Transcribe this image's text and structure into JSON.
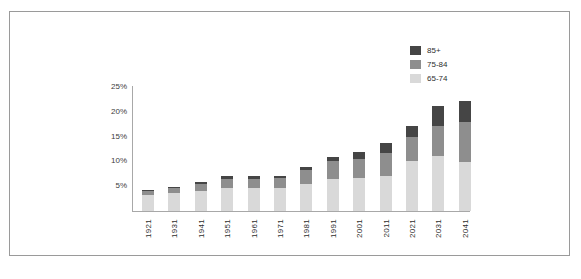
{
  "chart": {
    "frame_border_color": "#9a9a9a",
    "axis_color": "#a8a8a8"
  },
  "legend": {
    "position": "top-right",
    "items": [
      {
        "label": "85+",
        "color": "#454545"
      },
      {
        "label": "75-84",
        "color": "#8e8e8e"
      },
      {
        "label": "65-74",
        "color": "#d9d9d9"
      }
    ]
  },
  "yaxis": {
    "ticks": [
      "5%",
      "10%",
      "15%",
      "20%",
      "25%"
    ]
  },
  "caption": "",
  "chart_data": {
    "type": "bar",
    "stacked": true,
    "title": "",
    "xlabel": "",
    "ylabel": "",
    "ylim": [
      0,
      25
    ],
    "ytick_values": [
      5,
      10,
      15,
      20,
      25
    ],
    "ytick_labels": [
      "5%",
      "10%",
      "15%",
      "20%",
      "25%"
    ],
    "grid": false,
    "legend_position": "top-right",
    "categories": [
      "1921",
      "1931",
      "1941",
      "1951",
      "1961",
      "1971",
      "1981",
      "1991",
      "2001",
      "2011",
      "2021",
      "2031",
      "2041"
    ],
    "series": [
      {
        "name": "65-74",
        "color": "#d9d9d9",
        "values": [
          3.2,
          3.6,
          4.1,
          4.6,
          4.6,
          4.7,
          5.5,
          6.5,
          6.7,
          7.1,
          10.1,
          11.1,
          9.9
        ]
      },
      {
        "name": "75-84",
        "color": "#8e8e8e",
        "values": [
          0.8,
          1.0,
          1.4,
          1.9,
          1.9,
          2.0,
          2.8,
          3.5,
          3.8,
          4.6,
          4.8,
          6.1,
          8.0
        ]
      },
      {
        "name": "85+",
        "color": "#454545",
        "values": [
          0.2,
          0.3,
          0.4,
          0.5,
          0.5,
          0.4,
          0.6,
          0.9,
          1.4,
          2.0,
          2.2,
          4.0,
          4.3
        ]
      }
    ],
    "totals": [
      4.2,
      4.9,
      5.9,
      7.0,
      7.0,
      7.1,
      8.9,
      10.9,
      11.9,
      13.7,
      17.1,
      21.2,
      22.2
    ]
  }
}
